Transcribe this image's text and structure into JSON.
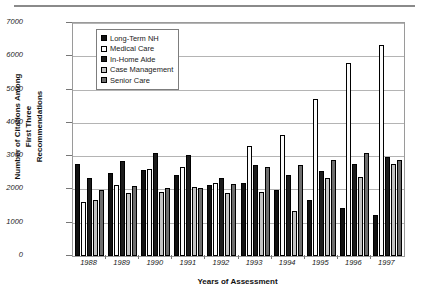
{
  "chart_data": {
    "type": "bar",
    "title": "",
    "xlabel": "Years of Assessment",
    "ylabel": "Number of Citations Among First Three Recommendations",
    "ylabel_lines": [
      "Number of Citations Among",
      "First Three",
      "Recommendations"
    ],
    "categories": [
      "1988",
      "1989",
      "1990",
      "1991",
      "1992",
      "1993",
      "1994",
      "1995",
      "1996",
      "1997"
    ],
    "ylim": [
      0,
      7000
    ],
    "yticks": [
      0,
      1000,
      2000,
      3000,
      4000,
      5000,
      6000,
      7000
    ],
    "ytick_labels": [
      "0",
      "1000",
      "2000",
      "3000",
      "4000",
      "5000",
      "6000",
      "7000"
    ],
    "grid": true,
    "legend_position": "top-left-inside",
    "series": [
      {
        "name": "Long-Term NH",
        "swatch": "#111111",
        "values": [
          2760,
          2500,
          2570,
          2440,
          2130,
          2180,
          1990,
          1690,
          1450,
          1230
        ]
      },
      {
        "name": "Medical Care",
        "swatch": "#fbfbfb",
        "values": [
          1610,
          2120,
          2600,
          2660,
          2200,
          3310,
          3650,
          4720,
          5790,
          6340
        ]
      },
      {
        "name": "In-Home Aide",
        "swatch": "#1c1c1c",
        "values": [
          2340,
          2860,
          3090,
          3020,
          2350,
          2720,
          2430,
          2560,
          2760,
          2960
        ]
      },
      {
        "name": "Case Management",
        "swatch": "#c2c2c2",
        "values": [
          1670,
          1890,
          1910,
          2080,
          1900,
          1930,
          1340,
          2340,
          2370,
          2750
        ]
      },
      {
        "name": "Senior Care",
        "swatch": "#6e6e6e",
        "values": [
          1990,
          2110,
          2030,
          2050,
          2150,
          2680,
          2740,
          2890,
          3090,
          2890
        ]
      }
    ]
  }
}
